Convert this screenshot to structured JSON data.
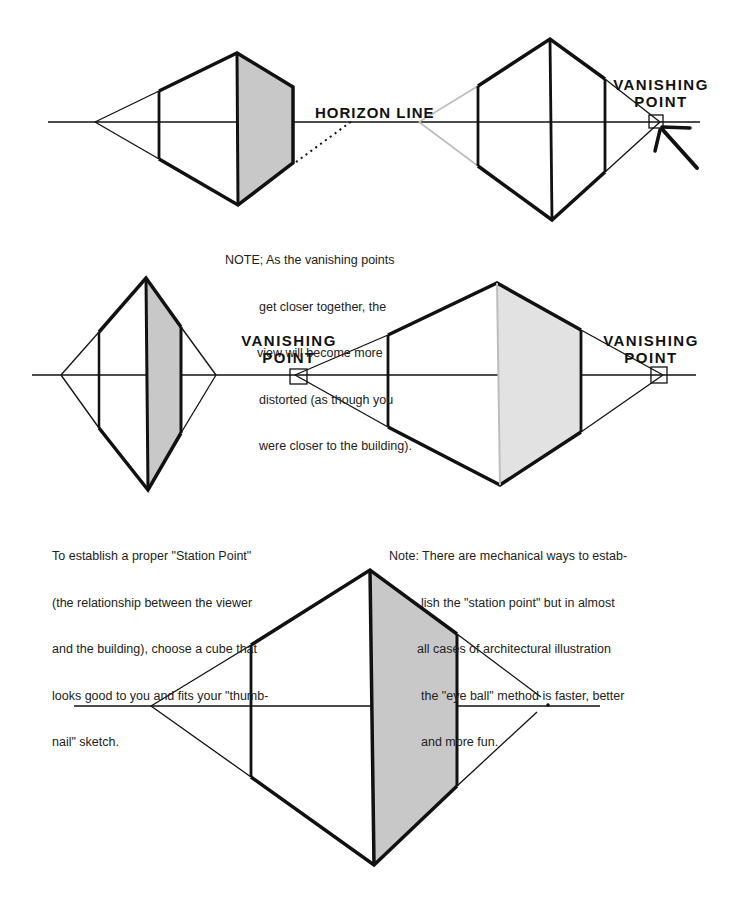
{
  "labels": {
    "horizon_line": "HORIZON  LINE",
    "vp_top_right_1": "VANISHING",
    "vp_top_right_2": "POINT",
    "vp_mid_left_1": "VANISHING",
    "vp_mid_left_2": "POINT",
    "vp_mid_right_1": "VANISHING",
    "vp_mid_right_2": "POINT"
  },
  "notes": {
    "distortion": {
      "lines": [
        "NOTE; As the vanishing points",
        "get closer together, the",
        "view will become more",
        "distorted (as though you",
        "were closer to the building)."
      ]
    },
    "station_point": {
      "lines": [
        "To establish a proper \"Station Point\"",
        "(the relationship between the viewer",
        "and the building), choose a cube that",
        "looks good to you and fits your \"thumb-",
        "nail\" sketch."
      ]
    },
    "mechanical": {
      "lines": [
        "Note: There are mechanical ways to estab-",
        "lish the \"station point\" but in almost",
        "all cases of architectural illustration",
        "the \"eye ball\" method is faster, better",
        "and more fun."
      ]
    }
  },
  "colors": {
    "ink": "#111111",
    "shade": "#c8c8c8",
    "shade_light": "#e2e2e2",
    "construction_gray": "#bdbdbd"
  }
}
